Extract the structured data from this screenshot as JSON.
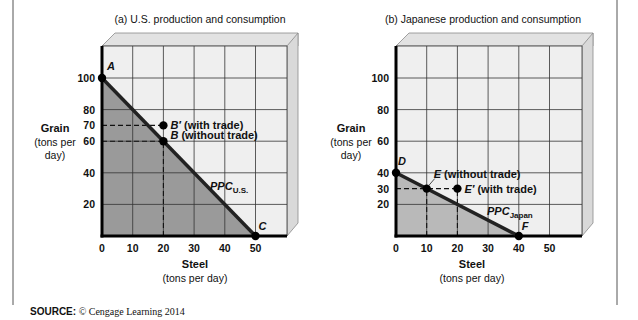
{
  "source": {
    "label": "SOURCE:",
    "text": "© Cengage Learning 2014"
  },
  "colors": {
    "frame_border": "#555555",
    "box_face": "#efefef",
    "box_side": "#d9d9d9",
    "box_top": "#e2e2e2",
    "box_edge": "#8a8a8a",
    "grid_line": "#333333",
    "shade_us": "#9a9a9a",
    "shade_japan": "#b9b9b9",
    "ppc_line": "#222222",
    "axis": "#000000"
  },
  "chart_data": [
    {
      "type": "line",
      "title": "(a) U.S. production and consumption",
      "xlabel": "Steel",
      "xlabel_sub": "(tons per day)",
      "ylabel": "Grain",
      "ylabel_sub": [
        "(tons per",
        "day)"
      ],
      "xlim": [
        0,
        60
      ],
      "ylim": [
        0,
        120
      ],
      "x_ticks": [
        0,
        10,
        20,
        30,
        40,
        50
      ],
      "y_ticks": [
        20,
        40,
        60,
        70,
        80,
        100
      ],
      "grid": {
        "x": [
          10,
          20,
          30,
          40,
          50
        ],
        "y": [
          20,
          40,
          60,
          80,
          100
        ]
      },
      "series": [
        {
          "name": "PPC U.S.",
          "label_main": "PPC",
          "label_sub": "U.S.",
          "x": [
            0,
            50
          ],
          "y": [
            100,
            0
          ],
          "shaded": true
        }
      ],
      "points": [
        {
          "label": "A",
          "x": 0,
          "y": 100
        },
        {
          "label": "B′",
          "x": 20,
          "y": 70,
          "note": "(with trade)"
        },
        {
          "label": "B",
          "x": 20,
          "y": 60,
          "note": "(without trade)"
        },
        {
          "label": "C",
          "x": 50,
          "y": 0
        }
      ],
      "dashed_guides": [
        {
          "from": [
            0,
            70
          ],
          "to": [
            20,
            70
          ]
        },
        {
          "from": [
            0,
            60
          ],
          "to": [
            20,
            60
          ]
        },
        {
          "from": [
            20,
            0
          ],
          "to": [
            20,
            60
          ]
        }
      ]
    },
    {
      "type": "line",
      "title": "(b) Japanese production and consumption",
      "xlabel": "Steel",
      "xlabel_sub": "(tons per day)",
      "ylabel": "Grain",
      "ylabel_sub": [
        "(tons per",
        "day)"
      ],
      "xlim": [
        0,
        60
      ],
      "ylim": [
        0,
        120
      ],
      "x_ticks": [
        0,
        10,
        20,
        30,
        40,
        50
      ],
      "y_ticks": [
        20,
        30,
        40,
        60,
        80,
        100
      ],
      "grid": {
        "x": [
          10,
          20,
          30,
          40,
          50
        ],
        "y": [
          20,
          40,
          60,
          80,
          100
        ]
      },
      "series": [
        {
          "name": "PPC Japan",
          "label_main": "PPC",
          "label_sub": "Japan",
          "x": [
            0,
            40
          ],
          "y": [
            40,
            0
          ],
          "shaded": true
        }
      ],
      "points": [
        {
          "label": "D",
          "x": 0,
          "y": 40
        },
        {
          "label": "E",
          "x": 10,
          "y": 30,
          "note": "(without trade)"
        },
        {
          "label": "E′",
          "x": 20,
          "y": 30,
          "note": "(with trade)"
        },
        {
          "label": "F",
          "x": 40,
          "y": 0
        }
      ],
      "dashed_guides": [
        {
          "from": [
            0,
            30
          ],
          "to": [
            20,
            30
          ]
        },
        {
          "from": [
            10,
            0
          ],
          "to": [
            10,
            30
          ]
        },
        {
          "from": [
            20,
            0
          ],
          "to": [
            20,
            30
          ]
        }
      ]
    }
  ],
  "layout": {
    "panels": [
      {
        "x0": 102,
        "y0": 236,
        "px_per_x": 3.07,
        "px_per_y": 1.58,
        "grid_right": 287,
        "grid_top": 46,
        "title_x": 200,
        "title_y": 23,
        "ylabel_x": 55,
        "ylabel_y": 132,
        "xlabel_x": 195,
        "xlabel_y": 268,
        "ppc_label": [
          210,
          190
        ],
        "labels": {
          "A": {
            "dx": 5,
            "dy": -8,
            "note_dx": 0
          },
          "B′": {
            "dx": 7,
            "dy": 4,
            "note_dx": 16
          },
          "B": {
            "dx": 7,
            "dy": -2,
            "note_dx": 12
          },
          "C": {
            "dx": 3,
            "dy": -6,
            "note_dx": 0
          }
        }
      },
      {
        "x0": 396,
        "y0": 236,
        "px_per_x": 3.07,
        "px_per_y": 1.58,
        "grid_right": 582,
        "grid_top": 46,
        "title_x": 483,
        "title_y": 23,
        "ylabel_x": 351,
        "ylabel_y": 132,
        "xlabel_x": 472,
        "xlabel_y": 268,
        "ppc_label": [
          487,
          215
        ],
        "labels": {
          "D": {
            "dx": 2,
            "dy": -8,
            "note_dx": 0
          },
          "E": {
            "dx": 7,
            "dy": -11,
            "note_dx": 10
          },
          "E′": {
            "dx": 7,
            "dy": 4,
            "note_dx": 15
          },
          "F": {
            "dx": 3,
            "dy": -6,
            "note_dx": 0
          }
        }
      }
    ]
  }
}
